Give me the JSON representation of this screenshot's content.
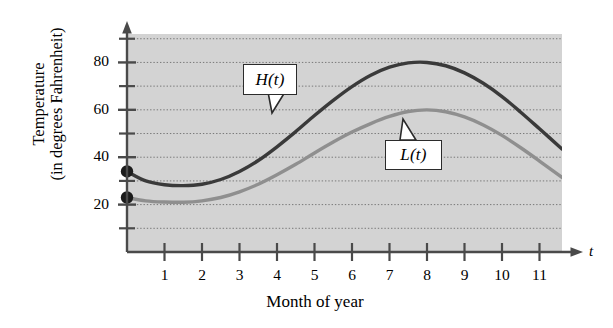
{
  "chart_data": {
    "type": "line",
    "title": "",
    "xlabel": "Month of year",
    "ylabel_line1": "Temperature",
    "ylabel_line2": "(in degrees Fahrenheit)",
    "x_axis_variable": "t",
    "xlim": [
      0,
      11.6
    ],
    "ylim": [
      0,
      92
    ],
    "x_tick_labels": [
      "1",
      "2",
      "3",
      "4",
      "5",
      "6",
      "7",
      "8",
      "9",
      "10",
      "11"
    ],
    "x_tick_values": [
      1,
      2,
      3,
      4,
      5,
      6,
      7,
      8,
      9,
      10,
      11
    ],
    "y_tick_labels": [
      "20",
      "40",
      "60",
      "80"
    ],
    "y_tick_values": [
      20,
      40,
      60,
      80
    ],
    "y_minor_tick_values": [
      10,
      30,
      50,
      70,
      90
    ],
    "grid": "horizontal dotted gridlines every 10 degrees",
    "legend_position": "inline callout labels on curves",
    "plot_background": "#d3d3d3",
    "series": [
      {
        "name": "H(t)",
        "label": "H(t)",
        "color": "#3a3a3a",
        "description": "High temperature curve",
        "start_point": {
          "t": 0,
          "value": 34,
          "marked": true
        },
        "minimum": {
          "t": 1.6,
          "value": 28
        },
        "maximum": {
          "t": 7.3,
          "value": 80
        },
        "end_point": {
          "t": 11.6,
          "value": 39
        },
        "x": [
          0,
          0.5,
          1,
          1.5,
          2,
          2.5,
          3,
          3.5,
          4,
          4.5,
          5,
          5.5,
          6,
          6.5,
          7,
          7.5,
          8,
          8.5,
          9,
          9.5,
          10,
          10.5,
          11,
          11.6
        ],
        "values": [
          34,
          30,
          28.4,
          28,
          28.6,
          30.6,
          34,
          38.6,
          44.4,
          50.8,
          57.6,
          64,
          69.8,
          74.6,
          78,
          79.8,
          80,
          78.6,
          75.6,
          71.2,
          65.6,
          59,
          52,
          43.5
        ]
      },
      {
        "name": "L(t)",
        "label": "L(t)",
        "color": "#8f8f8f",
        "description": "Low temperature curve",
        "start_point": {
          "t": 0,
          "value": 23,
          "marked": true
        },
        "minimum": {
          "t": 1.7,
          "value": 21
        },
        "maximum": {
          "t": 7.3,
          "value": 60
        },
        "end_point": {
          "t": 11.6,
          "value": 28
        },
        "x": [
          0,
          0.5,
          1,
          1.5,
          2,
          2.5,
          3,
          3.5,
          4,
          4.5,
          5,
          5.5,
          6,
          6.5,
          7,
          7.5,
          8,
          8.5,
          9,
          9.5,
          10,
          10.5,
          11,
          11.6
        ],
        "values": [
          23,
          21.6,
          21.1,
          21,
          21.6,
          23,
          25.4,
          28.6,
          32.6,
          37,
          41.8,
          46.4,
          50.6,
          54.2,
          57.2,
          59.3,
          60,
          59.2,
          57,
          53.6,
          49.2,
          44,
          38.4,
          31.5
        ]
      }
    ],
    "annotations": [
      {
        "name": "H(t)",
        "text": "H(t)",
        "points_to": "dark upper curve"
      },
      {
        "name": "L(t)",
        "text": "L(t)",
        "points_to": "gray lower curve"
      }
    ]
  }
}
